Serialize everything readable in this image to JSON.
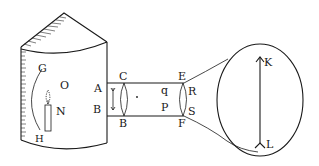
{
  "figure": {
    "ink_color": "#1a1a1a",
    "background": "#ffffff"
  },
  "labels": {
    "G": "G",
    "O": "O",
    "N": "N",
    "H": "H",
    "A": "A",
    "B_left": "B",
    "C": "C",
    "B_lens": "B",
    "E": "E",
    "F": "F",
    "q": "q",
    "P": "P",
    "R": "R",
    "S": "S",
    "K": "K",
    "L": "L"
  },
  "parts": {
    "chamber": "lantern-chamber",
    "mirror": "concave-mirror-GH",
    "lamp": "candle-N",
    "tube": "lens-tube",
    "lens1": "lens-CB",
    "lens2": "lens-EF",
    "screen": "projection-screen",
    "image": "projected-arrow-KL"
  }
}
